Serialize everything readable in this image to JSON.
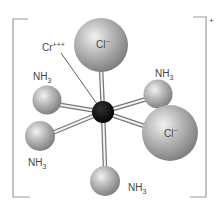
{
  "diagram": {
    "charge": "+",
    "central_atom": {
      "label": "Cr",
      "superscript": "+++"
    },
    "ligands": [
      {
        "id": "cl-top",
        "label": "Cl",
        "superscript": "−"
      },
      {
        "id": "nh3-upper-left",
        "label": "NH",
        "subscript": "3"
      },
      {
        "id": "nh3-upper-right",
        "label": "NH",
        "subscript": "3"
      },
      {
        "id": "cl-right",
        "label": "Cl",
        "superscript": "−"
      },
      {
        "id": "nh3-lower-left",
        "label": "NH",
        "subscript": "3"
      },
      {
        "id": "nh3-bottom",
        "label": "NH",
        "subscript": "3"
      }
    ],
    "colors": {
      "sphere": "#a8a8a8",
      "sphere_highlight": "#f0f0f0",
      "center": "#000000",
      "bracket": "#9a9a9a",
      "text": "#444444"
    }
  }
}
